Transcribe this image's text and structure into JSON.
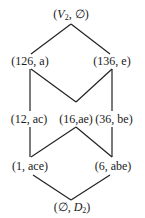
{
  "diagram": {
    "type": "lattice",
    "nodes": [
      {
        "id": "top",
        "label": "(V2, ∅)",
        "pair": [
          "V2",
          "∅"
        ]
      },
      {
        "id": "n126",
        "label": "(126, a)",
        "pair": [
          "126",
          "a"
        ]
      },
      {
        "id": "n136",
        "label": "(136, e)",
        "pair": [
          "136",
          "e"
        ]
      },
      {
        "id": "n12",
        "label": "(12, ac)",
        "pair": [
          "12",
          "ac"
        ]
      },
      {
        "id": "n16",
        "label": "(16,ae)",
        "pair": [
          "16",
          "ae"
        ]
      },
      {
        "id": "n36",
        "label": "(36, be)",
        "pair": [
          "36",
          "be"
        ]
      },
      {
        "id": "n1",
        "label": "(1, ace)",
        "pair": [
          "1",
          "ace"
        ]
      },
      {
        "id": "n6",
        "label": "(6, abe)",
        "pair": [
          "6",
          "abe"
        ]
      },
      {
        "id": "bottom",
        "label": "(∅, D2)",
        "pair": [
          "∅",
          "D2"
        ]
      }
    ],
    "edges": [
      [
        "top",
        "n126"
      ],
      [
        "top",
        "n136"
      ],
      [
        "n126",
        "n12"
      ],
      [
        "n126",
        "n16"
      ],
      [
        "n136",
        "n16"
      ],
      [
        "n136",
        "n36"
      ],
      [
        "n12",
        "n1"
      ],
      [
        "n16",
        "n1"
      ],
      [
        "n16",
        "n6"
      ],
      [
        "n36",
        "n6"
      ],
      [
        "n1",
        "bottom"
      ],
      [
        "n6",
        "bottom"
      ]
    ],
    "labels": {
      "top_v": "V",
      "top_v_sub": "2",
      "top_empty": "∅",
      "n126": "(126, a)",
      "n136": "(136, e)",
      "n12": "(12, ac)",
      "n16": "(16,ae)",
      "n36": "(36, be)",
      "n1": "(1, ace)",
      "n6": "(6, abe)",
      "bottom_empty": "∅",
      "bottom_d": "D",
      "bottom_d_sub": "2"
    }
  }
}
